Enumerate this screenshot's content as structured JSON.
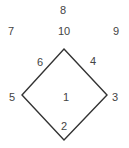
{
  "diagram": {
    "type": "baseball-positions",
    "line_color": "#333333",
    "text_color": "#444444",
    "diamond": {
      "top": [
        64,
        49
      ],
      "right": [
        107,
        95
      ],
      "bottom": [
        64,
        140
      ],
      "left": [
        22,
        95
      ]
    },
    "positions": [
      {
        "label": "1",
        "x": 66,
        "y": 101
      },
      {
        "label": "2",
        "x": 64,
        "y": 130
      },
      {
        "label": "3",
        "x": 115,
        "y": 101
      },
      {
        "label": "4",
        "x": 93,
        "y": 65
      },
      {
        "label": "5",
        "x": 12,
        "y": 101
      },
      {
        "label": "6",
        "x": 40,
        "y": 66
      },
      {
        "label": "7",
        "x": 11,
        "y": 35
      },
      {
        "label": "8",
        "x": 63,
        "y": 14
      },
      {
        "label": "9",
        "x": 116,
        "y": 35
      },
      {
        "label": "10",
        "x": 64,
        "y": 35
      }
    ]
  }
}
